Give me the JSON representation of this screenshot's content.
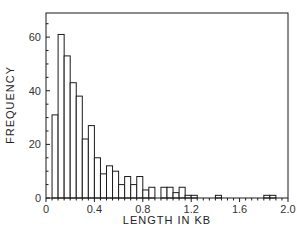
{
  "chart_data": {
    "type": "bar",
    "title": "",
    "xlabel": "LENGTH IN KB",
    "ylabel": "FREQUENCY",
    "xlim": [
      0,
      2.0
    ],
    "ylim": [
      0,
      69
    ],
    "bin_width": 0.05,
    "x_ticks": [
      "0",
      "0.4",
      "0.8",
      "1.2",
      "1.6",
      "2.0"
    ],
    "y_ticks": [
      "0",
      "20",
      "40",
      "60"
    ],
    "grid": false,
    "legend": null,
    "bins": [
      0.0,
      0.05,
      0.1,
      0.15,
      0.2,
      0.25,
      0.3,
      0.35,
      0.4,
      0.45,
      0.5,
      0.55,
      0.6,
      0.65,
      0.7,
      0.75,
      0.8,
      0.85,
      0.9,
      0.95,
      1.0,
      1.05,
      1.1,
      1.15,
      1.2,
      1.25,
      1.3,
      1.35,
      1.4,
      1.45,
      1.5,
      1.55,
      1.6,
      1.65,
      1.7,
      1.75,
      1.8,
      1.85,
      1.9,
      1.95
    ],
    "values": [
      0,
      31,
      61,
      53,
      43,
      38,
      22,
      27,
      15,
      9,
      12,
      10,
      5,
      8,
      5,
      8,
      3,
      4,
      0,
      4,
      4,
      2,
      4,
      1,
      1,
      0,
      0,
      0,
      1,
      0,
      0,
      0,
      0,
      0,
      0,
      0,
      1,
      1,
      0,
      0
    ]
  },
  "axes": {
    "x_label": "LENGTH IN KB",
    "y_label": "FREQUENCY",
    "x_tick_labels": [
      "0",
      "0.4",
      "0.8",
      "1.2",
      "1.6",
      "2.0"
    ],
    "y_tick_labels": [
      "0",
      "20",
      "40",
      "60"
    ]
  },
  "colors": {
    "stroke": "#1a1a1a",
    "fill": "#ffffff",
    "text": "#333333"
  }
}
